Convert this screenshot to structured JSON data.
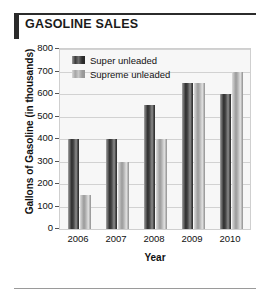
{
  "header": {
    "title": "GASOLINE SALES",
    "accent_color": "#2b2b2b"
  },
  "chart_data": {
    "type": "bar",
    "title": "GASOLINE SALES",
    "xlabel": "Year",
    "ylabel": "Gallons of Gasoline (in thousands)",
    "categories": [
      "2006",
      "2007",
      "2008",
      "2009",
      "2010"
    ],
    "ylim": [
      0,
      800
    ],
    "yticks": [
      0,
      100,
      200,
      300,
      400,
      500,
      600,
      700,
      800
    ],
    "ytick_labels": [
      "0",
      "100",
      "200",
      "300",
      "400",
      "500",
      "600",
      "700",
      "800"
    ],
    "grid": true,
    "legend_position": "top-left-inside",
    "series": [
      {
        "name": "Super unleaded",
        "color": "#2e2e2e",
        "values": [
          400,
          400,
          550,
          650,
          600
        ]
      },
      {
        "name": "Supreme unleaded",
        "color": "#b5b5b5",
        "values": [
          150,
          300,
          400,
          650,
          700
        ]
      }
    ]
  }
}
